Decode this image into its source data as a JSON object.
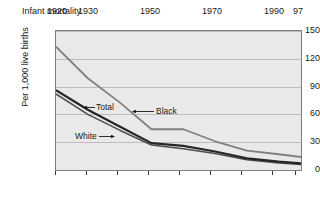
{
  "chart_data": {
    "type": "line",
    "title": "Infant mortality",
    "xlabel": "",
    "ylabel": "Per 1,000 live births",
    "x": [
      1920,
      1930,
      1940,
      1950,
      1960,
      1970,
      1980,
      1990,
      1997
    ],
    "xlim": [
      1920,
      1997
    ],
    "ylim": [
      0,
      150
    ],
    "yticks": [
      0,
      30,
      60,
      90,
      120,
      150
    ],
    "ytick_labels": [
      "0",
      "30",
      "60",
      "90",
      "120",
      "150"
    ],
    "xtick_values": [
      1920,
      1930,
      1940,
      1950,
      1960,
      1970,
      1980,
      1990,
      1997
    ],
    "xtick_labels": [
      "1920",
      "1930",
      "",
      "1950",
      "",
      "1970",
      "",
      "1990",
      "97"
    ],
    "grid": true,
    "legend_position": "inline-annotations",
    "series": [
      {
        "name": "Black",
        "color": "#808080",
        "values": [
          133,
          99,
          73,
          44,
          44,
          31,
          21,
          17,
          14
        ]
      },
      {
        "name": "Total",
        "color": "#262626",
        "values": [
          86,
          65,
          47,
          29,
          26,
          20,
          12.5,
          9,
          7.1
        ]
      },
      {
        "name": "White",
        "color": "#4d4d4d",
        "values": [
          82,
          60,
          43,
          27,
          23,
          17.8,
          11,
          7.6,
          6
        ]
      }
    ],
    "annotations": [
      {
        "label": "Total",
        "text_x": 96,
        "text_y": 106,
        "arrow": "left"
      },
      {
        "label": "Black",
        "text_x": 156,
        "text_y": 110,
        "arrow": "left"
      },
      {
        "label": "White",
        "text_x": 75,
        "text_y": 135,
        "arrow": "right"
      }
    ]
  }
}
